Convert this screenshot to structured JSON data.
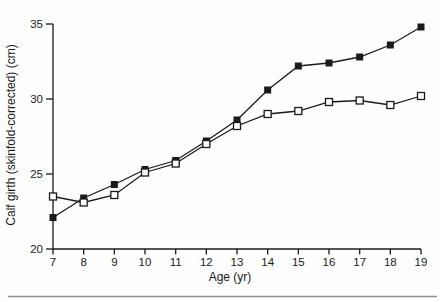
{
  "figure": {
    "background": "#fefefe",
    "axis_color": "#1a1a1a",
    "line_color": "#1a1a1a",
    "marker_open_fill": "#ffffff",
    "bottom_rule_color": "#8f8f8f"
  },
  "chart_data": {
    "type": "line",
    "title": "",
    "xlabel": "Age (yr)",
    "ylabel": "Calf girth (skinfold-corrected) (cm)",
    "x": [
      7,
      8,
      9,
      10,
      11,
      12,
      13,
      14,
      15,
      16,
      17,
      18,
      19
    ],
    "xticks": [
      7,
      8,
      9,
      10,
      11,
      12,
      13,
      14,
      15,
      16,
      17,
      18,
      19
    ],
    "yticks": [
      20,
      25,
      30,
      35
    ],
    "xlim": [
      7,
      19
    ],
    "ylim": [
      20,
      35
    ],
    "grid": false,
    "legend": "none",
    "series": [
      {
        "name": "filled-square-series",
        "marker": "filled-square",
        "color": "#1a1a1a",
        "values": [
          22.1,
          23.4,
          24.3,
          25.3,
          25.9,
          27.2,
          28.6,
          30.6,
          32.2,
          32.4,
          32.8,
          33.6,
          34.8
        ]
      },
      {
        "name": "open-square-series",
        "marker": "open-square",
        "color": "#1a1a1a",
        "values": [
          23.5,
          23.1,
          23.6,
          25.1,
          25.7,
          27.0,
          28.2,
          29.0,
          29.2,
          29.8,
          29.9,
          29.6,
          30.2
        ]
      }
    ]
  }
}
